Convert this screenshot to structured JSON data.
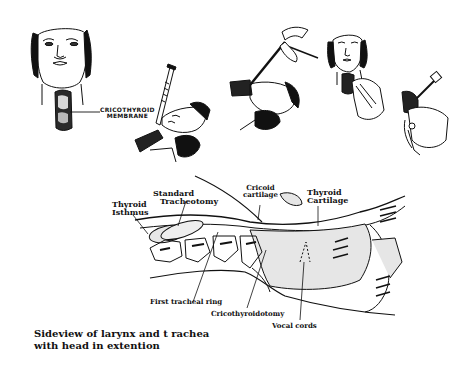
{
  "procedure_panels": [
    {
      "name": "front-view-neck",
      "label_line1": "CRICOTHYROID",
      "label_line2": "MEMBRANE"
    },
    {
      "name": "syringe-insertion"
    },
    {
      "name": "scalpel-incision"
    },
    {
      "name": "dilation-front-view"
    },
    {
      "name": "tube-insertion"
    }
  ],
  "anatomy_labels": {
    "thyroid_isthmus_1": "Thyroid",
    "thyroid_isthmus_2": "Isthmus",
    "standard_tracheotomy_1": "Standard",
    "standard_tracheotomy_2": "Tracheotomy",
    "cricoid_cartilage_1": "Cricoid",
    "cricoid_cartilage_2": "cartilage",
    "thyroid_cartilage_1": "Thyroid",
    "thyroid_cartilage_2": "Cartilage",
    "first_tracheal_ring": "First tracheal ring",
    "cricothyroidotomy": "Cricothyroidotomy",
    "vocal_cords": "Vocal cords"
  },
  "caption": {
    "line1": "Sideview of larynx and t rachea",
    "line2": "with head in extention"
  },
  "colors": {
    "ink": "#111111",
    "shade": "#e6e6e6",
    "background": "#ffffff"
  }
}
